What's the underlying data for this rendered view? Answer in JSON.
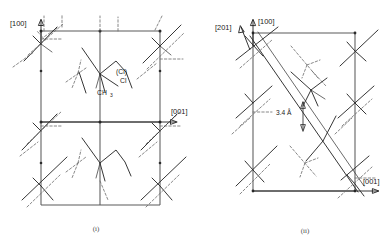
{
  "figure": {
    "background_color": "#ffffff",
    "line_color": "#2b2b2b",
    "cell_color": "#5b5b5b",
    "dashed_color": "#6a6a6a"
  },
  "panels": [
    {
      "id": "panel-i",
      "caption": "(i)",
      "axes": [
        {
          "name": "vertical-axis",
          "label": "[100]",
          "direction": "up"
        },
        {
          "name": "horizontal-axis",
          "label": "[001]",
          "direction": "right"
        }
      ],
      "atom_labels": [
        {
          "name": "chlorine-minor-label",
          "text": "(Cl)"
        },
        {
          "name": "chlorine-label",
          "text": "Cl"
        },
        {
          "name": "methyl-label",
          "text": "CH"
        },
        {
          "name": "methyl-subscript",
          "text": "3"
        }
      ]
    },
    {
      "id": "panel-ii",
      "caption": "(ii)",
      "axes": [
        {
          "name": "vertical-axis",
          "label": "[100]",
          "direction": "up"
        },
        {
          "name": "diagonal-axis",
          "label": "[201]",
          "direction": "up-left"
        },
        {
          "name": "horizontal-axis",
          "label": "[001]",
          "direction": "right"
        }
      ],
      "annotations": [
        {
          "name": "stacking-distance",
          "text": "3.4 Å"
        }
      ]
    }
  ]
}
